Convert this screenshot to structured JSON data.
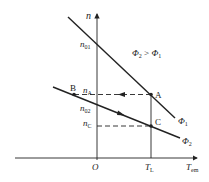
{
  "diagram": {
    "type": "mechanical-characteristic",
    "axes": {
      "x_label": "T",
      "x_label_sub": "em",
      "y_label": "n",
      "origin_label": "O",
      "x_tick_label": "T",
      "x_tick_sub": "L"
    },
    "y_ticks": [
      {
        "main": "n",
        "sub": "01"
      },
      {
        "main": "n",
        "sub": "A"
      },
      {
        "main": "n",
        "sub": "02"
      },
      {
        "main": "n",
        "sub": "C"
      }
    ],
    "points": {
      "A": "A",
      "B": "B",
      "C": "C"
    },
    "curves": [
      {
        "name": "Φ",
        "sub": "1"
      },
      {
        "name": "Φ",
        "sub": "2"
      }
    ],
    "annotation": {
      "lhs": "Φ",
      "lhs_sub": "2",
      "op": " > ",
      "rhs": "Φ",
      "rhs_sub": "1"
    },
    "colors": {
      "line": "#222222",
      "background": "#ffffff"
    }
  }
}
